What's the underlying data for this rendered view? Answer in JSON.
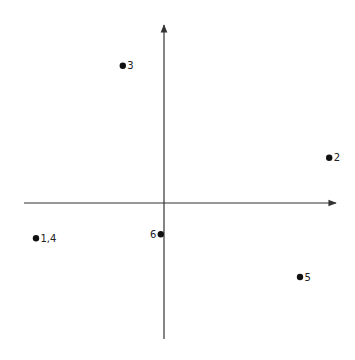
{
  "chart_data": {
    "type": "scatter",
    "title": "",
    "xlabel": "",
    "ylabel": "",
    "xlim": [
      -3.5,
      4.3
    ],
    "ylim": [
      -3.4,
      4.45
    ],
    "grid": false,
    "legend": "none",
    "points": [
      {
        "label": "3",
        "x": -1.03,
        "y": 3.43,
        "label_side": "right"
      },
      {
        "label": "2",
        "x": 4.13,
        "y": 1.13,
        "label_side": "right"
      },
      {
        "label": "1,4",
        "x": -3.2,
        "y": -0.88,
        "label_side": "right"
      },
      {
        "label": "6",
        "x": -0.08,
        "y": -0.78,
        "label_side": "left"
      },
      {
        "label": "5",
        "x": 3.4,
        "y": -1.85,
        "label_side": "right"
      }
    ]
  }
}
